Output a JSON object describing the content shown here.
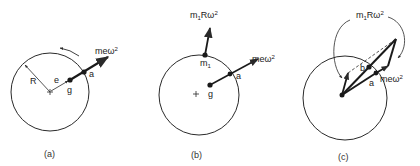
{
  "figure": {
    "panels": [
      {
        "id": "a",
        "caption": "(a)",
        "labels": {
          "radius": "R",
          "eccentricity": "e",
          "center_of_gravity": "g",
          "point": "a",
          "force_base": "meω",
          "force_exp": "2"
        }
      },
      {
        "id": "b",
        "caption": "(b)",
        "labels": {
          "mass": "m",
          "mass_sub": "1",
          "mass_force_base_m": "m",
          "mass_force_sub": "1",
          "mass_force_rest": "Rω",
          "mass_force_exp": "2",
          "center_of_gravity": "g",
          "point": "a",
          "force_base": "meω",
          "force_exp": "2"
        }
      },
      {
        "id": "c",
        "caption": "(c)",
        "labels": {
          "mass_force_base_m": "m",
          "mass_force_sub": "1",
          "mass_force_rest": "Rω",
          "mass_force_exp": "2",
          "point_b": "b",
          "point_a": "a",
          "force_base": "meω",
          "force_exp": "2"
        }
      }
    ],
    "colors": {
      "line": "#2a2a2a",
      "background": "#ffffff"
    }
  }
}
